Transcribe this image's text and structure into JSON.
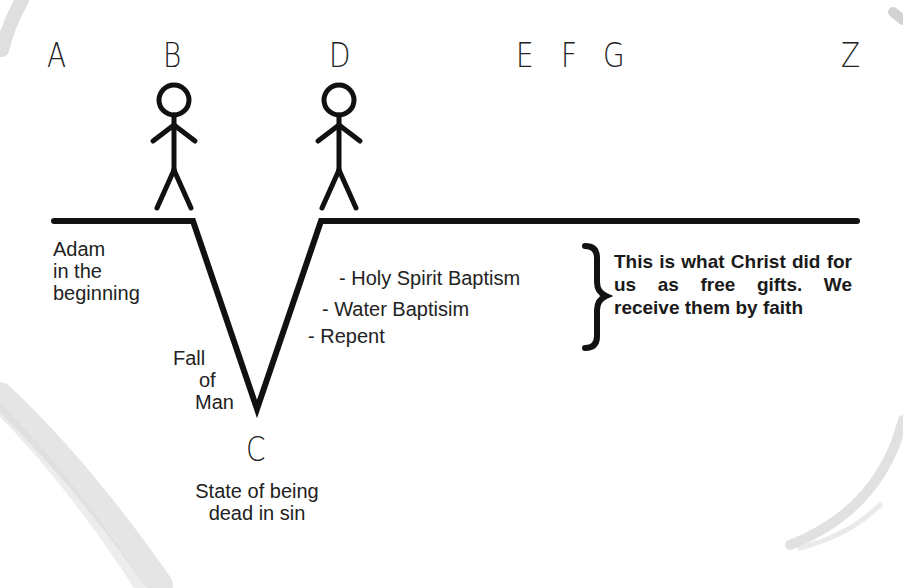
{
  "diagram": {
    "colors": {
      "line": "#111111",
      "text": "#222222",
      "brush_stroke": "#d9d9d9",
      "background": "#ffffff"
    },
    "timeline_points": [
      {
        "id": "A",
        "label": "A"
      },
      {
        "id": "B",
        "label": "B"
      },
      {
        "id": "D",
        "label": "D"
      },
      {
        "id": "E",
        "label": "E"
      },
      {
        "id": "F",
        "label": "F"
      },
      {
        "id": "G",
        "label": "G"
      },
      {
        "id": "Z",
        "label": "Z"
      }
    ],
    "low_point": {
      "id": "C",
      "label": "C",
      "caption_line1": "State of being",
      "caption_line2": "dead in sin"
    },
    "figures": [
      {
        "at": "B",
        "icon": "stick-figure-icon"
      },
      {
        "at": "D",
        "icon": "stick-figure-icon"
      }
    ],
    "adam_label": {
      "line1": "Adam",
      "line2": "in the",
      "line3": "beginning"
    },
    "fall_label": {
      "line1": "Fall",
      "line2": "of",
      "line3": "Man"
    },
    "steps": [
      {
        "text": "- Holy Spirit Baptism"
      },
      {
        "text": "- Water Baptisim"
      },
      {
        "text": "- Repent"
      }
    ],
    "brace_icon": "right-curly-brace-icon",
    "note": "This is what Christ did for us as free gifts.  We receive them by faith"
  }
}
